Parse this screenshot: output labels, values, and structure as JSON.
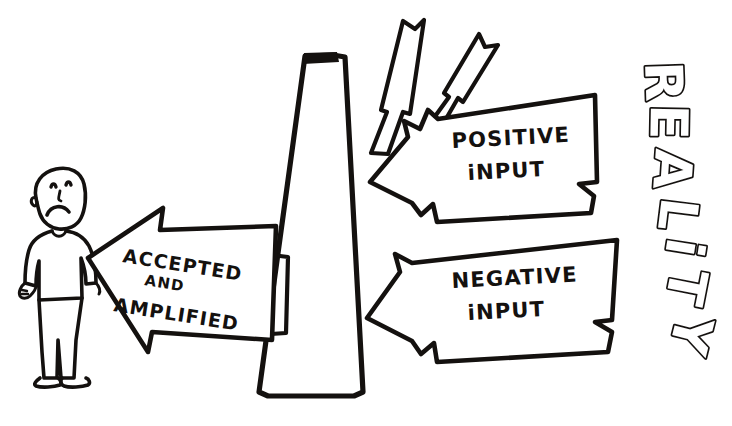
{
  "image": {
    "title": "Negativity filter sketch",
    "style": "hand-drawn black ink on white",
    "width": 732,
    "height": 426,
    "ink_color": "#14110f",
    "background_color": "#ffffff"
  },
  "figure": {
    "name": "worried-person"
  },
  "filter": {
    "name": "filter-cone",
    "description": "tall narrow triangle with flat top, acts as a barrier between reality and the person"
  },
  "labels": {
    "accepted": {
      "line1": "ACCEPTED",
      "line2": "AND",
      "line3": "AMPLIFIED"
    },
    "positive": {
      "line1": "POSITIVE",
      "line2": "iNPUT"
    },
    "negative": {
      "line1": "NEGATIVE",
      "line2": "iNPUT"
    },
    "reality": {
      "text": "REALITY",
      "letters": [
        "R",
        "E",
        "A",
        "L",
        "i",
        "T",
        "Y"
      ],
      "orientation": "vertical, rotated 90 degrees clockwise, 3D block outline letters"
    }
  },
  "arrows": {
    "accepted_and_amplified": {
      "direction": "left",
      "target": "worried-person",
      "label_ref": "labels.accepted"
    },
    "positive_input": {
      "direction": "left",
      "origin": "reality",
      "label_ref": "labels.positive",
      "outcome": "deflected upward by the filter"
    },
    "negative_input": {
      "direction": "left",
      "origin": "reality",
      "label_ref": "labels.negative",
      "outcome": "passes through the filter"
    },
    "deflection": {
      "count": 2,
      "direction": "up",
      "description": "two upward arrows showing positive input bouncing off the filter"
    }
  }
}
